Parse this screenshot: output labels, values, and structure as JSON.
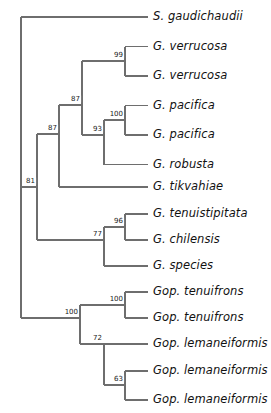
{
  "figure": {
    "kind": "phylogenetic-tree",
    "orientation": "left-to-right",
    "background_color": "#ffffff",
    "branch_color": "#6e6e6e",
    "text_color": "#111111",
    "leaf_count": 14,
    "support_node_count": 11
  },
  "taxa": [
    {
      "id": "leaf-0",
      "label": "S. gaudichaudii"
    },
    {
      "id": "leaf-1",
      "label": "G. verrucosa"
    },
    {
      "id": "leaf-2",
      "label": "G. verrucosa"
    },
    {
      "id": "leaf-3",
      "label": "G. pacifica"
    },
    {
      "id": "leaf-4",
      "label": "G. pacifica"
    },
    {
      "id": "leaf-5",
      "label": "G. robusta"
    },
    {
      "id": "leaf-6",
      "label": "G. tikvahiae"
    },
    {
      "id": "leaf-7",
      "label": "G. tenuistipitata"
    },
    {
      "id": "leaf-8",
      "label": "G. chilensis"
    },
    {
      "id": "leaf-9",
      "label": "G. species"
    },
    {
      "id": "leaf-10",
      "label": "Gop. tenuifrons"
    },
    {
      "id": "leaf-11",
      "label": "Gop. tenuifrons"
    },
    {
      "id": "leaf-12",
      "label": "Gop. lemaneiformis"
    },
    {
      "id": "leaf-13",
      "label": "Gop. lemaneiformis"
    },
    {
      "id": "leaf-14",
      "label": "Gop. lemaneiformis"
    }
  ],
  "support_values": [
    {
      "id": "node-99a",
      "value": "99",
      "clade": "G. verrucosa + G. verrucosa"
    },
    {
      "id": "node-100a",
      "value": "100",
      "clade": "G. pacifica + G. pacifica"
    },
    {
      "id": "node-93",
      "value": "93",
      "clade": "G. pacifica clade + G. robusta"
    },
    {
      "id": "node-87a",
      "value": "87",
      "clade": "G. verrucosa clade + G. pacifica/robusta clade"
    },
    {
      "id": "node-87b",
      "value": "87",
      "clade": "upper Gracilaria clade + G. tikvahiae"
    },
    {
      "id": "node-81",
      "value": "81",
      "clade": "Gracilaria ingroup"
    },
    {
      "id": "node-96",
      "value": "96",
      "clade": "G. tenuistipitata + G. chilensis"
    },
    {
      "id": "node-77",
      "value": "77",
      "clade": "G. tenuistipitata/chilensis + G. species"
    },
    {
      "id": "node-100b",
      "value": "100",
      "clade": "Gop. tenuifrons + Gop. tenuifrons"
    },
    {
      "id": "node-100c",
      "value": "100",
      "clade": "Gracilariopsis clade"
    },
    {
      "id": "node-72",
      "value": "72",
      "clade": "Gop. lemaneiformis clade"
    },
    {
      "id": "node-63",
      "value": "63",
      "clade": "Gop. lemaneiformis pair"
    }
  ],
  "tree_geometry": {
    "leaf_y": [
      17,
      46.5,
      76,
      105.5,
      135,
      164.5,
      187,
      214,
      240,
      266,
      292,
      318,
      344,
      371,
      400
    ],
    "leaf_tip_x": 148,
    "label_x": 153,
    "root_x": 21,
    "root_top_y": 17,
    "root_bottom_y": 318
  }
}
